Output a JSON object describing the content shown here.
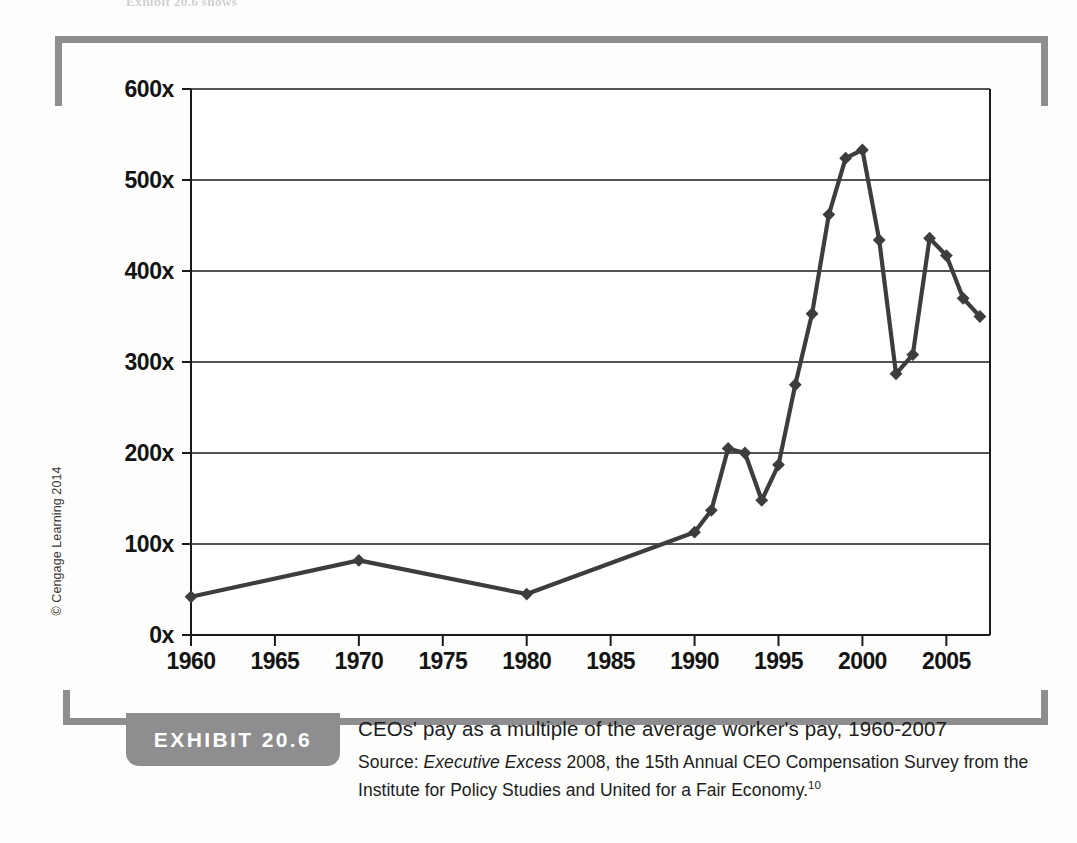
{
  "page": {
    "top_cut_text": "Exhibit 20.6 shows",
    "copyright": "© Cengage Learning 2014"
  },
  "exhibit": {
    "badge_label": "EXHIBIT 20.6",
    "title": "CEOs' pay as a multiple of the average worker's pay, 1960-2007",
    "source_prefix": "Source: ",
    "source_italic": "Executive Excess",
    "source_rest": " 2008, the 15th Annual CEO Compensation Survey from the Institute for Policy Studies and United for a Fair Economy.",
    "footnote": "10"
  },
  "colors": {
    "line": "#3d3d3d",
    "bracket": "#8e8e90",
    "badge": "#8e8e90",
    "grid": "#1a1a1a",
    "text": "#141414",
    "plot_background": "#ffffff"
  },
  "chart_data": {
    "type": "line",
    "title": "CEOs' pay as a multiple of the average worker's pay, 1960-2007",
    "xlabel": "",
    "ylabel": "",
    "xlim": [
      1960,
      2007.6
    ],
    "ylim": [
      0,
      600
    ],
    "yticks": [
      0,
      100,
      200,
      300,
      400,
      500,
      600
    ],
    "ytick_labels": [
      "0x",
      "100x",
      "200x",
      "300x",
      "400x",
      "500x",
      "600x"
    ],
    "xticks": [
      1960,
      1965,
      1970,
      1975,
      1980,
      1985,
      1990,
      1995,
      2000,
      2005
    ],
    "xtick_labels": [
      "1960",
      "1965",
      "1970",
      "1975",
      "1980",
      "1985",
      "1990",
      "1995",
      "2000",
      "2005"
    ],
    "grid": "horizontal",
    "legend": "none",
    "marker": "diamond",
    "series": [
      {
        "name": "CEO pay as multiple of average worker pay",
        "x": [
          1960,
          1970,
          1980,
          1990,
          1991,
          1992,
          1993,
          1994,
          1995,
          1996,
          1997,
          1998,
          1999,
          2000,
          2001,
          2002,
          2003,
          2004,
          2005,
          2006,
          2007
        ],
        "values": [
          42,
          82,
          45,
          113,
          137,
          205,
          200,
          148,
          187,
          275,
          353,
          462,
          524,
          533,
          434,
          287,
          308,
          436,
          417,
          370,
          350
        ]
      }
    ]
  }
}
